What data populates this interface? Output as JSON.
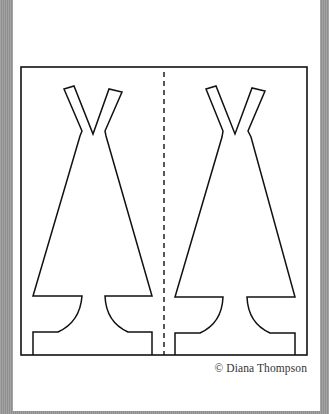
{
  "credit": "© Diana Thompson",
  "colors": {
    "background_gray": "#9a9a9a",
    "page": "#ffffff",
    "ink": "#111111"
  },
  "template": {
    "frame": {
      "x": 21,
      "y": 67,
      "width": 286,
      "height": 288
    },
    "fold_line": {
      "x": 164,
      "y1": 72,
      "y2": 355,
      "dash": "5,4"
    },
    "teepees": [
      {
        "name": "left",
        "points": "33,355 33,332 58,332 Q 80,322 82,296 L 33,296 80,136 82,131 64,89 74,86 93,134 109,89 122,92 105,131 106,136 152,296 105,296 Q 106,322 128,332 L 152,332 152,355"
      },
      {
        "name": "right",
        "points": "175,355 175,333 200,333 Q 222,323 223,297 L 175,297 222,137 223,131 206,89 216,86 235,134 252,88 265,91 248,131 251,137 295,297 247,297 Q 248,323 270,333 L 295,333 295,355"
      }
    ]
  }
}
